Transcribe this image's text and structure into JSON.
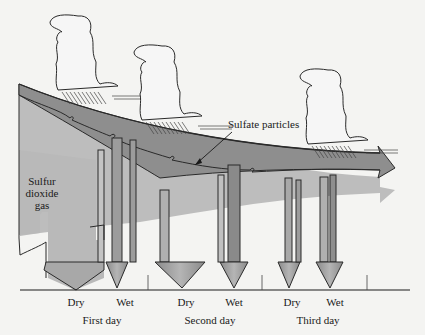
{
  "diagram": {
    "labels": {
      "sulfur_dioxide_gas": [
        "Sulfur",
        "dioxide",
        "gas"
      ],
      "sulfate_particles": "Sulfate particles"
    },
    "days": [
      {
        "label": "First day",
        "dry": "Dry",
        "wet": "Wet"
      },
      {
        "label": "Second day",
        "dry": "Dry",
        "wet": "Wet"
      },
      {
        "label": "Third day",
        "dry": "Dry",
        "wet": "Wet"
      }
    ],
    "clouds": [
      {
        "name": "cloud-1",
        "x": 70,
        "y": 15
      },
      {
        "name": "cloud-2",
        "x": 150,
        "y": 42
      },
      {
        "name": "cloud-3",
        "x": 310,
        "y": 65
      }
    ],
    "colors": {
      "background": "#f4f4f2",
      "gas_fill": "#b9b9b9",
      "sulfate_fill": "#8e8e8e",
      "outline": "#2a2a2a"
    }
  }
}
